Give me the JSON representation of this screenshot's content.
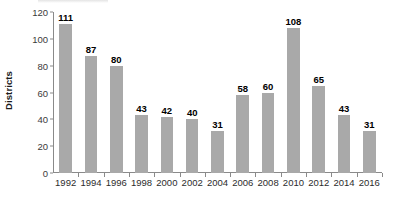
{
  "chart_data": {
    "type": "bar",
    "title": "",
    "xlabel": "",
    "ylabel": "Districts",
    "categories": [
      "1992",
      "1994",
      "1996",
      "1998",
      "2000",
      "2002",
      "2004",
      "2006",
      "2008",
      "2010",
      "2012",
      "2014",
      "2016"
    ],
    "values": [
      111,
      87,
      80,
      43,
      42,
      40,
      31,
      58,
      60,
      108,
      65,
      43,
      31
    ],
    "value_labels": [
      "111",
      "87",
      "80",
      "43",
      "42",
      "40",
      "31",
      "58",
      "60",
      "108",
      "65",
      "43",
      "31"
    ],
    "ylim": [
      0,
      120
    ],
    "y_ticks": [
      0,
      20,
      40,
      60,
      80,
      100,
      120
    ],
    "y_tick_labels": [
      "0",
      "20",
      "40",
      "60",
      "80",
      "100",
      "120"
    ],
    "grid": false,
    "legend": false,
    "legend_position": "none",
    "series": [
      {
        "name": "Districts",
        "values": [
          111,
          87,
          80,
          43,
          42,
          40,
          31,
          58,
          60,
          108,
          65,
          43,
          31
        ]
      }
    ],
    "colors": {
      "bar": "#a9a9a9",
      "axis": "#8a8a8a",
      "value_label": "#000000",
      "tick_label": "#3a3a3a",
      "category_label": "#2c2c2c",
      "background": "#ffffff"
    }
  }
}
